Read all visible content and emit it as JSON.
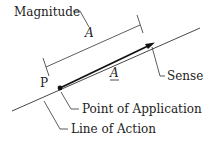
{
  "diagram": {
    "labels": {
      "magnitude": "Magnitude",
      "magnitude_symbol": "A",
      "vector_symbol": "A",
      "point": "P",
      "sense": "Sense",
      "point_of_application": "Point of Application",
      "line_of_action": "Line of Action"
    },
    "colors": {
      "line": "#333333",
      "text": "#222222",
      "background": "#ffffff"
    }
  }
}
